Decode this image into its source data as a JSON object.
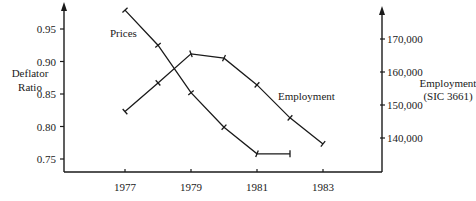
{
  "chart_data": {
    "type": "line",
    "title": "",
    "x": [
      1977,
      1978,
      1979,
      1980,
      1981,
      1982,
      1983
    ],
    "xlabel": "",
    "x_tick_labels": [
      "1977",
      "1979",
      "1981",
      "1983"
    ],
    "y_left": {
      "label_line1": "Deflator",
      "label_line2": "Ratio",
      "ticks": [
        "0.75",
        "0.80",
        "0.85",
        "0.90",
        "0.95"
      ],
      "range": [
        0.73,
        0.985
      ]
    },
    "y_right": {
      "label_line1": "Employment",
      "label_line2": "(SIC 3661)",
      "ticks": [
        "140,000",
        "150,000",
        "160,000",
        "170,000"
      ],
      "range": [
        130000,
        180000
      ]
    },
    "series": [
      {
        "name": "Prices",
        "axis": "left",
        "x": [
          1977,
          1978,
          1979,
          1980,
          1981,
          1982
        ],
        "values": [
          0.979,
          0.925,
          0.852,
          0.799,
          0.758,
          0.758
        ]
      },
      {
        "name": "Employment",
        "axis": "right",
        "x": [
          1977,
          1978,
          1979,
          1980,
          1981,
          1982,
          1983
        ],
        "values": [
          148000,
          156700,
          165500,
          164200,
          156100,
          146100,
          138200
        ]
      }
    ],
    "grid": false,
    "legend": "inline labels"
  }
}
